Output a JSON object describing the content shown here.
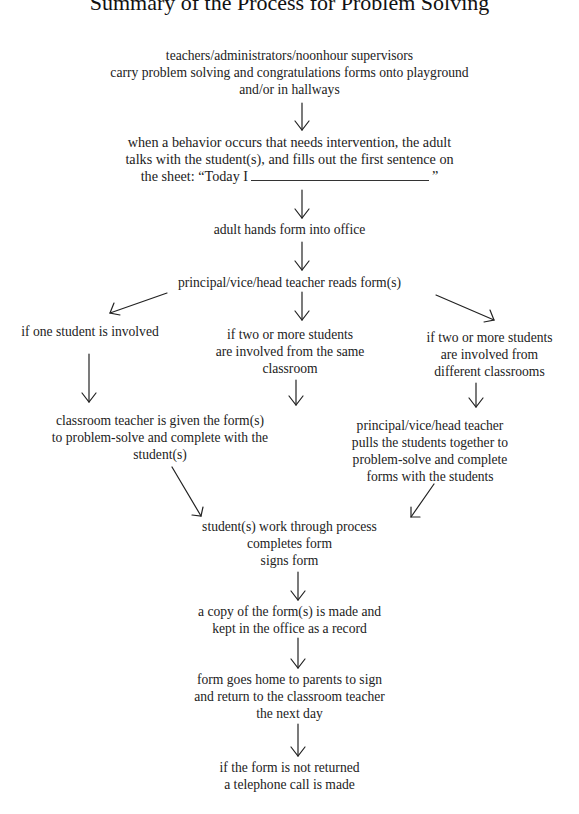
{
  "title": "Summary of the Process for Problem Solving",
  "steps": {
    "carry_forms": [
      "teachers/administrators/noonhour supervisors",
      "carry problem solving and congratulations forms onto playground",
      "and/or in hallways"
    ],
    "behavior_occurs": [
      "when a behavior occurs that needs intervention, the adult",
      "talks with the student(s), and fills out the first sentence on"
    ],
    "sheet_prefix": "the sheet: “Today I",
    "sheet_suffix": "”",
    "hand_in": "adult hands form into office",
    "reads_forms": "principal/vice/head teacher reads form(s)",
    "branch_one": "if one student is involved",
    "branch_same": [
      "if two or more students",
      "are involved from the same",
      "classroom"
    ],
    "branch_different": [
      "if two or more students",
      "are involved from",
      "different classrooms"
    ],
    "teacher_given": [
      "classroom teacher is given the form(s)",
      "to problem-solve and complete with the",
      "student(s)"
    ],
    "principal_pulls": [
      "principal/vice/head teacher",
      "pulls the students together to",
      "problem-solve and complete",
      "forms with the students"
    ],
    "students_work": [
      "student(s) work through process",
      "completes form",
      "signs form"
    ],
    "copy_made": [
      "a copy of the form(s) is made and",
      "kept in the office as a record"
    ],
    "goes_home": [
      "form goes home to parents to sign",
      "and return to the classroom teacher",
      "the next day"
    ],
    "not_returned": [
      "if the form is not returned",
      "a telephone call is made"
    ]
  }
}
